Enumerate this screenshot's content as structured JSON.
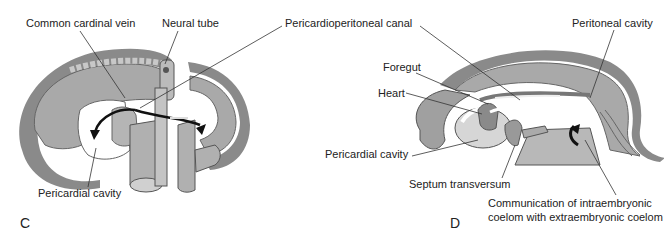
{
  "panels": [
    {
      "letter": "C",
      "labels": {
        "common_cardinal_vein": "Common cardinal vein",
        "neural_tube": "Neural tube",
        "pericardial_cavity": "Pericardial cavity"
      }
    },
    {
      "letter": "D",
      "labels": {
        "foregut": "Foregut",
        "heart": "Heart",
        "pericardial_cavity": "Pericardial cavity",
        "septum_transversum": "Septum transversum",
        "peritoneal_cavity": "Peritoneal cavity",
        "communication_line1": "Communication of intraembryonic",
        "communication_line2": "coelom with extraembryonic coelom"
      }
    }
  ],
  "shared_labels": {
    "pericardioperitoneal_canal": "Pericardioperitoneal canal"
  },
  "colors": {
    "tissue": "#a9a9a9",
    "tissue_light": "#c8c8c8",
    "outline": "#555555",
    "cavity": "#ffffff",
    "arrow": "#111111"
  }
}
